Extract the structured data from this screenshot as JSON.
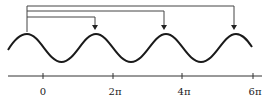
{
  "diagram": {
    "axis": {
      "tick_labels": [
        "0",
        "2π",
        "4π",
        "6π"
      ]
    },
    "arrows": [
      {
        "from": "peak-0",
        "to": "peak-1"
      },
      {
        "from": "peak-0",
        "to": "peak-2"
      },
      {
        "from": "peak-0",
        "to": "peak-3"
      }
    ],
    "colors": {
      "stroke": "#1a1a1a",
      "bracket": "#444444"
    }
  }
}
